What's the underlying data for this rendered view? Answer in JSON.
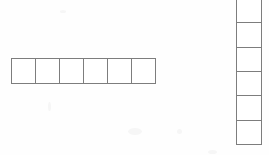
{
  "figure": {
    "title": "",
    "background_color": "#fefefe",
    "stroke_color": "#7d7d7d",
    "fill_color": "#ffffff",
    "width": 269,
    "height": 155
  },
  "shapes": [
    {
      "name": "horizontal-strip",
      "orientation": "horizontal",
      "cell_count": 6,
      "cell_labels": [
        "",
        "",
        "",
        "",
        "",
        ""
      ],
      "x": 11,
      "y": 58,
      "cell_size": 24
    },
    {
      "name": "vertical-strip",
      "orientation": "vertical",
      "cell_count": 6,
      "cell_labels": [
        "",
        "",
        "",
        "",
        "",
        ""
      ],
      "x": 236,
      "y": -2,
      "cell_size": 24
    }
  ]
}
